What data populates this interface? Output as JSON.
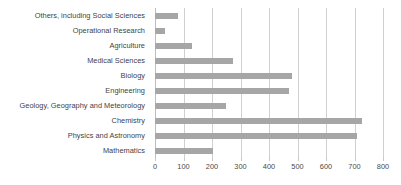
{
  "chart_data": {
    "type": "bar",
    "orientation": "horizontal",
    "title": "",
    "xlabel": "",
    "ylabel": "",
    "xlim": [
      0,
      800
    ],
    "ylim": null,
    "grid": "vertical",
    "legend": "none",
    "bar_color": "#a6a6a6",
    "gridline_color": "#d0d0d0",
    "text_color": "#3f3f3f",
    "xticks": [
      0,
      100,
      200,
      300,
      400,
      500,
      600,
      700,
      800
    ],
    "xticklabels": [
      "0",
      "100",
      "200",
      "300",
      "400",
      "500",
      "600",
      "700",
      "800"
    ],
    "categories": [
      "Others, including Social Sciences",
      "Operational Research",
      "Agriculture",
      "Medical Sciences",
      "Biology",
      "Engineering",
      "Geology, Geography and Meteorology",
      "Chemistry",
      "Physics and Astronomy",
      "Mathematics"
    ],
    "values": [
      80,
      35,
      130,
      275,
      480,
      470,
      250,
      725,
      710,
      205
    ]
  }
}
